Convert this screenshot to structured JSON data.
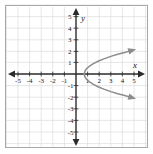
{
  "chart_data": {
    "type": "line",
    "title": "",
    "xlabel": "x",
    "ylabel": "y",
    "xlim": [
      -6,
      6
    ],
    "ylim": [
      -6,
      6
    ],
    "grid": true,
    "legend": null,
    "x_ticks": [
      -5,
      -4,
      -3,
      -2,
      -1,
      1,
      2,
      3,
      4,
      5
    ],
    "y_ticks": [
      5,
      4,
      3,
      2,
      1,
      -1,
      -2,
      -3,
      -4,
      -5
    ],
    "x_tick_labels": [
      "-5",
      "-4",
      "-3",
      "-2",
      "-1",
      "1",
      "2",
      "3",
      "4",
      "5"
    ],
    "y_tick_labels": [
      "5",
      "4",
      "3",
      "2",
      "1",
      "-1",
      "-2",
      "-3",
      "-4",
      "-5"
    ],
    "series": [
      {
        "name": "sideways-parabola-upper-branch",
        "color": "#8c8c8c",
        "arrow_end": true,
        "points": [
          [
            0.7,
            0.0
          ],
          [
            0.8,
            0.32
          ],
          [
            0.95,
            0.5
          ],
          [
            1.2,
            0.71
          ],
          [
            1.5,
            0.89
          ],
          [
            1.9,
            1.1
          ],
          [
            2.4,
            1.3
          ],
          [
            3.0,
            1.52
          ],
          [
            3.6,
            1.7
          ],
          [
            4.2,
            1.85
          ],
          [
            4.6,
            1.97
          ]
        ],
        "note": "upper half of x = y^2 + 0.7 style curve, drawn in plot coords as y increasing"
      },
      {
        "name": "sideways-parabola-lower-branch",
        "color": "#8c8c8c",
        "arrow_end": true,
        "points": [
          [
            0.7,
            0.0
          ],
          [
            0.8,
            -0.32
          ],
          [
            0.95,
            -0.5
          ],
          [
            1.2,
            -0.71
          ],
          [
            1.5,
            -0.89
          ],
          [
            1.9,
            -1.1
          ],
          [
            2.4,
            -1.3
          ],
          [
            3.0,
            -1.52
          ],
          [
            3.6,
            -1.7
          ],
          [
            4.2,
            -1.85
          ],
          [
            4.6,
            -1.97
          ]
        ]
      }
    ],
    "curve_screen": {
      "upper_path": "M 83 74 C 92 62 101 46 109 30 L 118 14",
      "lower_path": "M 83 74 C 92 86 101 102 109 118 L 118 134",
      "upper_arrow": "M 118 14 L 114.4 22.6 L 121.8 20.3 Z",
      "lower_arrow": "M 118 134 L 114.4 125.4 L 121.8 127.7 Z"
    },
    "colors": {
      "curve": "#8c8c8c",
      "axis": "#2b2b2b",
      "grid": "#dcdcdc",
      "border": "#a8a8a8",
      "text": "#1a1a1a",
      "background": "#ffffff"
    },
    "origin_px": [
      76,
      74
    ],
    "unit_px": 11.6
  }
}
